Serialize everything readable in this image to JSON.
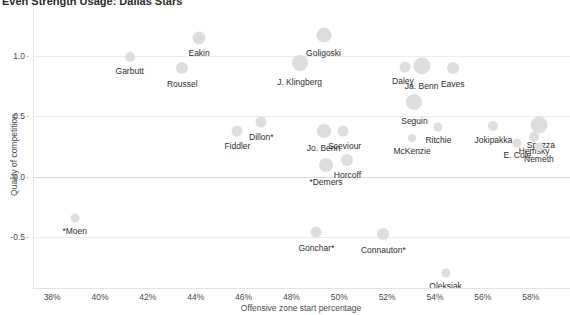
{
  "chart_data": {
    "type": "scatter",
    "title": "Even Strength Usage: Dallas Stars",
    "xlabel": "Offensive zone start percentage",
    "ylabel": "Quality of competition",
    "xlim": [
      37.2,
      59.6
    ],
    "ylim": [
      -0.92,
      1.38
    ],
    "xticks": [
      38,
      40,
      42,
      44,
      46,
      48,
      50,
      52,
      54,
      56,
      58
    ],
    "xticklabels": [
      "38%",
      "40%",
      "42%",
      "44%",
      "46%",
      "48%",
      "50%",
      "52%",
      "54%",
      "56%",
      "58%"
    ],
    "yticks": [
      1.0,
      0.5,
      0.0,
      -0.5
    ],
    "yticklabels": [
      "1.0",
      "0.5",
      "0.0",
      "-0.5"
    ],
    "grid": true,
    "legend": "none",
    "bubble_color": "#dedede",
    "size_meaning": "ice time",
    "points": [
      {
        "label": "Eakin",
        "x": 44.1,
        "y": 1.15,
        "size": 13,
        "label_dx": 0,
        "label_dy": 9
      },
      {
        "label": "Garbutt",
        "x": 41.2,
        "y": 0.99,
        "size": 10,
        "label_dx": 0,
        "label_dy": 9
      },
      {
        "label": "Goligoski",
        "x": 49.3,
        "y": 1.17,
        "size": 15,
        "label_dx": 0,
        "label_dy": 10
      },
      {
        "label": "J. Klingberg",
        "x": 48.3,
        "y": 0.94,
        "size": 16,
        "label_dx": 0,
        "label_dy": 11
      },
      {
        "label": "Roussel",
        "x": 43.4,
        "y": 0.9,
        "size": 12,
        "label_dx": 0,
        "label_dy": 10
      },
      {
        "label": "Daley",
        "x": 52.7,
        "y": 0.91,
        "size": 11,
        "label_dx": -2,
        "label_dy": 9
      },
      {
        "label": "Ja. Benn",
        "x": 53.4,
        "y": 0.92,
        "size": 17,
        "label_dx": 0,
        "label_dy": 12
      },
      {
        "label": "Eaves",
        "x": 54.7,
        "y": 0.9,
        "size": 12,
        "label_dx": 0,
        "label_dy": 10
      },
      {
        "label": "Seguin",
        "x": 53.1,
        "y": 0.62,
        "size": 16,
        "label_dx": 0,
        "label_dy": 11
      },
      {
        "label": "Dillon*",
        "x": 46.7,
        "y": 0.45,
        "size": 11,
        "label_dx": 0,
        "label_dy": 9
      },
      {
        "label": "Fiddler",
        "x": 45.7,
        "y": 0.38,
        "size": 11,
        "label_dx": 0,
        "label_dy": 10
      },
      {
        "label": "Jo. Benn",
        "x": 49.3,
        "y": 0.38,
        "size": 14,
        "label_dx": 0,
        "label_dy": 10
      },
      {
        "label": "Sceviour",
        "x": 50.1,
        "y": 0.38,
        "size": 11,
        "label_dx": 2,
        "label_dy": 10
      },
      {
        "label": "Ritchie",
        "x": 54.1,
        "y": 0.41,
        "size": 9,
        "label_dx": 0,
        "label_dy": 8
      },
      {
        "label": "McKenzie",
        "x": 53.0,
        "y": 0.32,
        "size": 8,
        "label_dx": 0,
        "label_dy": 9
      },
      {
        "label": "Jokipakka",
        "x": 56.4,
        "y": 0.42,
        "size": 10,
        "label_dx": 0,
        "label_dy": 9
      },
      {
        "label": "Spezza",
        "x": 58.3,
        "y": 0.43,
        "size": 17,
        "label_dx": 2,
        "label_dy": 12
      },
      {
        "label": "Hemsky",
        "x": 58.1,
        "y": 0.33,
        "size": 10,
        "label_dx": 0,
        "label_dy": 9
      },
      {
        "label": "E. Cole",
        "x": 57.4,
        "y": 0.28,
        "size": 9,
        "label_dx": 0,
        "label_dy": 8
      },
      {
        "label": "Nemeth",
        "x": 58.3,
        "y": 0.25,
        "size": 9,
        "label_dx": 0,
        "label_dy": 8
      },
      {
        "label": "Horcoff",
        "x": 50.3,
        "y": 0.14,
        "size": 12,
        "label_dx": 0,
        "label_dy": 9
      },
      {
        "label": "*Demers",
        "x": 49.4,
        "y": 0.1,
        "size": 14,
        "label_dx": 0,
        "label_dy": 10
      },
      {
        "label": "*Moen",
        "x": 38.9,
        "y": -0.34,
        "size": 9,
        "label_dx": 0,
        "label_dy": 9
      },
      {
        "label": "Gonchar*",
        "x": 49.0,
        "y": -0.46,
        "size": 11,
        "label_dx": 0,
        "label_dy": 10
      },
      {
        "label": "Connauton*",
        "x": 51.8,
        "y": -0.47,
        "size": 12,
        "label_dx": 0,
        "label_dy": 10
      },
      {
        "label": "Oleksiak",
        "x": 54.4,
        "y": -0.8,
        "size": 9,
        "label_dx": 0,
        "label_dy": 8
      }
    ]
  }
}
